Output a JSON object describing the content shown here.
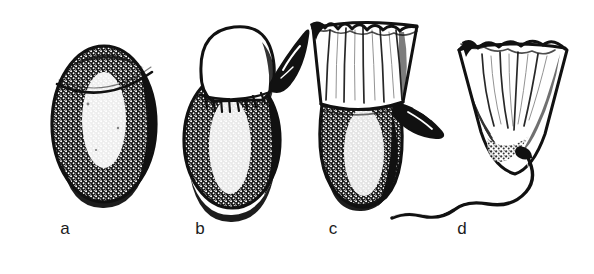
{
  "figure": {
    "kind": "scientific-line-illustration",
    "technique": "ink-hatching",
    "background_color": "#ffffff",
    "ink_color": "#111111",
    "label_color": "#1c1c1c",
    "width": 594,
    "height": 274,
    "caption_labels": [
      "a",
      "b",
      "c",
      "d"
    ],
    "panels": [
      {
        "id": "a",
        "label": "a",
        "label_x": 65,
        "label_y": 228,
        "stage_name": "closed-oval-body",
        "description": "Intact egg-shaped body with a fine transverse lid seam near the apex; heavy stippled shading on both flanks, pale highlight down the centre.",
        "has_lid_seam": true,
        "has_appendage": false,
        "has_flared_cup": false,
        "has_stalk": false
      },
      {
        "id": "b",
        "label": "b",
        "label_x": 200,
        "label_y": 228,
        "stage_name": "lid-lifting-with-appendage",
        "description": "Rounded pale cap raised clear of the body at a fringed junction; a dark pointed leaf-like appendage projects up and to the right.",
        "has_lid_seam": false,
        "has_appendage": true,
        "has_flared_cup": false,
        "has_stalk": false
      },
      {
        "id": "c",
        "label": "c",
        "label_x": 333,
        "label_y": 228,
        "stage_name": "flared-torn-cup-on-body",
        "description": "Torn, outward-flaring cup with ragged rim and vertical striations rising from the dark stippled body; a dark leaf-like appendage angles down to the right.",
        "has_lid_seam": false,
        "has_appendage": true,
        "has_flared_cup": true,
        "has_stalk": false
      },
      {
        "id": "d",
        "label": "d",
        "label_x": 462,
        "label_y": 228,
        "stage_name": "detached-cup-with-wavy-stalk",
        "description": "Detached inverted bell-shaped cup with a scalloped lobed rim and vertical striations; a long wavy stalk trails from its base down and away to the left.",
        "has_lid_seam": false,
        "has_appendage": false,
        "has_flared_cup": true,
        "has_stalk": true
      }
    ]
  }
}
